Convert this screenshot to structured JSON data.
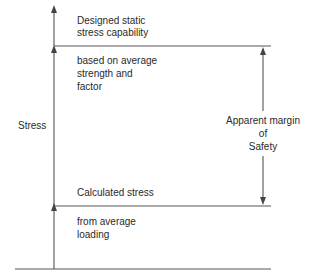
{
  "diagram": {
    "y_axis_label": "Stress",
    "levels": {
      "capability": {
        "title_line1": "Designed static",
        "title_line2": "stress capability",
        "note_line1": "based on average",
        "note_line2": "strength and",
        "note_line3": "factor"
      },
      "calculated": {
        "title": "Calculated stress",
        "note_line1": "from average",
        "note_line2": "loading"
      }
    },
    "margin": {
      "line1": "Apparent margin",
      "line2": "of",
      "line3": "Safety"
    },
    "colors": {
      "line": "#555555",
      "text": "#2a2a2a",
      "background": "#ffffff"
    }
  }
}
